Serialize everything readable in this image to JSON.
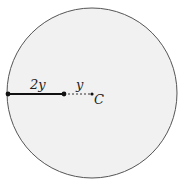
{
  "diagram": {
    "circle": {
      "cx": 92,
      "cy": 93,
      "r": 85,
      "fill": "#f1f1f1",
      "stroke": "#555555"
    },
    "points": {
      "edge": {
        "x": 8,
        "y": 94
      },
      "mid": {
        "x": 64,
        "y": 94
      },
      "center": {
        "x": 92,
        "y": 94
      }
    },
    "labels": {
      "solid_segment": "2y",
      "dashed_segment": "y",
      "center": "C"
    },
    "colors": {
      "line": "#111111",
      "dashed": "#333333"
    }
  }
}
